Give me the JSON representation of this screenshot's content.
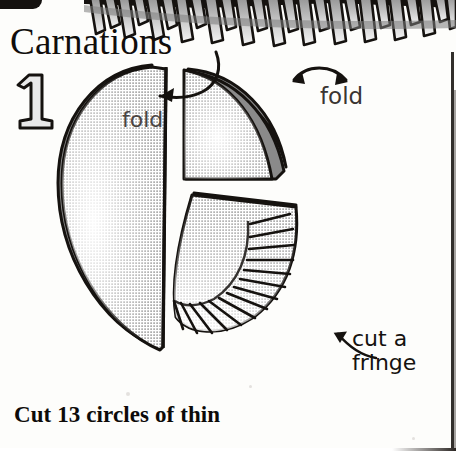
{
  "page": {
    "title": "Carnations",
    "step_number": "1",
    "caption": "Cut 13 circles of thin",
    "background_color": "#fdfdfb",
    "ink_color": "#100d0b",
    "paper_fill_color": "#b9b9b9",
    "fold_band_color": "#8a8a8a"
  },
  "labels": {
    "fold_left": "fold",
    "fold_right": "fold",
    "cut_fringe": "cut a\nfringe"
  },
  "icons": {
    "arrow_left": "curved-arrow-left-icon",
    "arrow_right": "double-headed-arrow-icon",
    "arrow_fringe": "curved-arrow-up-left-icon",
    "top_border": "fringed-paper-border-icon"
  },
  "illustration": {
    "pieces": [
      {
        "name": "half-circle",
        "fringed": false,
        "fold_edge": "curved-rim"
      },
      {
        "name": "quarter-circle-plain",
        "fringed": false,
        "fold_edge": "curved-rim"
      },
      {
        "name": "quarter-circle-fringed",
        "fringed": true,
        "fringe_cuts": 14,
        "fold_edge": "straight-top"
      }
    ],
    "fringe_cut_count": "14"
  }
}
